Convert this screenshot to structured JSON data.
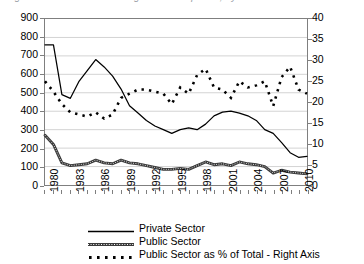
{
  "title": {
    "text_cropped": "Figure 2. Number of Housing Units Completed, by Sector"
  },
  "chart_data": {
    "type": "line",
    "title": "",
    "xlabel": "",
    "ylabel": "",
    "y2label": "",
    "grid": true,
    "legend_position": "bottom",
    "ylim": [
      0,
      900
    ],
    "y2lim": [
      0,
      40
    ],
    "yticks": [
      0,
      100,
      200,
      300,
      400,
      500,
      600,
      700,
      800,
      900
    ],
    "y2ticks": [
      0,
      5,
      10,
      15,
      20,
      25,
      30,
      35,
      40
    ],
    "x": [
      1980,
      1981,
      1982,
      1983,
      1984,
      1985,
      1986,
      1987,
      1988,
      1989,
      1990,
      1991,
      1992,
      1993,
      1994,
      1995,
      1996,
      1997,
      1998,
      1999,
      2000,
      2001,
      2002,
      2003,
      2004,
      2005,
      2006,
      2007,
      2008,
      2009,
      2010,
      2011
    ],
    "xtick_labels": [
      "1980",
      "1983",
      "1986",
      "1989",
      "1992",
      "1995",
      "1998",
      "2001",
      "2004",
      "2007",
      "2010"
    ],
    "xtick_values": [
      1980,
      1983,
      1986,
      1989,
      1992,
      1995,
      1998,
      2001,
      2004,
      2007,
      2010
    ],
    "series": [
      {
        "name": "Private Sector",
        "axis": "left",
        "style": "solid",
        "color": "#000000",
        "values": [
          760,
          760,
          490,
          470,
          560,
          620,
          680,
          640,
          590,
          520,
          430,
          390,
          350,
          320,
          300,
          280,
          300,
          310,
          300,
          330,
          375,
          395,
          400,
          390,
          375,
          350,
          300,
          280,
          230,
          175,
          150,
          155
        ]
      },
      {
        "name": "Public Sector",
        "axis": "left",
        "style": "textured",
        "color": "#3a3a3a",
        "values": [
          270,
          220,
          120,
          105,
          110,
          115,
          135,
          120,
          115,
          135,
          120,
          115,
          105,
          95,
          85,
          85,
          90,
          85,
          105,
          125,
          110,
          115,
          105,
          125,
          115,
          110,
          100,
          65,
          80,
          70,
          65,
          60
        ]
      },
      {
        "name": "Public Sector as % of Total - Right Axis",
        "axis": "right",
        "style": "dashed",
        "color": "#000000",
        "values": [
          25.0,
          22.5,
          19.5,
          17.5,
          17.0,
          16.5,
          17.5,
          16.0,
          17.0,
          21.0,
          22.0,
          23.0,
          23.0,
          22.5,
          22.0,
          19.5,
          23.5,
          22.0,
          26.5,
          28.0,
          23.5,
          23.0,
          21.0,
          25.0,
          23.5,
          24.0,
          25.0,
          19.0,
          26.0,
          28.5,
          23.0,
          22.0
        ]
      }
    ]
  },
  "legend": {
    "items": [
      {
        "label": "Private Sector",
        "style": "solid"
      },
      {
        "label": "Public Sector",
        "style": "textured"
      },
      {
        "label": "Public Sector as % of Total - Right Axis",
        "style": "dashed"
      }
    ]
  }
}
